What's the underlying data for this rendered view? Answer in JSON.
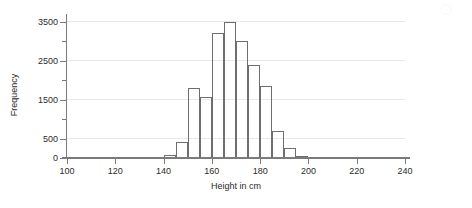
{
  "chart_data": {
    "type": "bar",
    "title": "",
    "xlabel": "Height in cm",
    "ylabel": "Frequency",
    "xlim": [
      100,
      240
    ],
    "ylim": [
      0,
      3700
    ],
    "bin_width": 5,
    "grid": "horizontal",
    "legend": "none",
    "xticks": [
      100,
      120,
      140,
      160,
      180,
      200,
      220,
      240
    ],
    "yticks": [
      0,
      500,
      1500,
      2500,
      3500
    ],
    "yticks_minor": [
      1000,
      2000,
      3000
    ],
    "gridlines": [
      500,
      1500,
      2500,
      3500
    ],
    "categories": [
      "100-105",
      "105-110",
      "110-115",
      "115-120",
      "120-125",
      "125-130",
      "130-135",
      "135-140",
      "140-145",
      "145-150",
      "150-155",
      "155-160",
      "160-165",
      "165-170",
      "170-175",
      "175-180",
      "180-185",
      "185-190",
      "190-195",
      "195-200",
      "200-205",
      "205-210"
    ],
    "bin_starts": [
      100,
      105,
      110,
      115,
      120,
      125,
      130,
      135,
      140,
      145,
      150,
      155,
      160,
      165,
      170,
      175,
      180,
      185,
      190,
      195,
      200,
      205
    ],
    "values": [
      0,
      0,
      0,
      0,
      5,
      10,
      15,
      30,
      70,
      400,
      1800,
      1570,
      3200,
      3500,
      3000,
      2400,
      1850,
      700,
      250,
      60,
      20,
      0
    ],
    "peak_bin": "165-170",
    "peak_value": 3500
  },
  "axis": {
    "x_title": "Height in cm",
    "y_title": "Frequency",
    "x_tick_labels": [
      "100",
      "120",
      "140",
      "160",
      "180",
      "200",
      "220",
      "240"
    ],
    "y_tick_labels": [
      "0",
      "500",
      "1500",
      "2500",
      "3500"
    ]
  }
}
